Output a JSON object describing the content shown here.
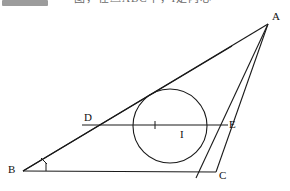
{
  "header": {
    "highlight_swatch_color": "#8e8e8e",
    "clipped_text": "图，在△ABC中，I是内心"
  },
  "figure": {
    "type": "geometry-diagram",
    "stroke_color": "#1a1a1a",
    "background_color": "#ffffff",
    "labels": {
      "a": "A",
      "b": "B",
      "c": "C",
      "d": "D",
      "e": "E",
      "i": "I"
    },
    "points": {
      "A": {
        "x": 268,
        "y": 24
      },
      "B": {
        "x": 23,
        "y": 171
      },
      "C": {
        "x": 216,
        "y": 172
      },
      "D": {
        "x": 99,
        "y": 125
      },
      "E": {
        "x": 227,
        "y": 125
      },
      "I": {
        "x": 176,
        "y": 125
      }
    },
    "incircle": {
      "cx": 170,
      "cy": 126,
      "r": 37
    },
    "segments": [
      {
        "name": "side-AB",
        "from": "A",
        "to": "B"
      },
      {
        "name": "side-BC",
        "from": "B",
        "to": "C"
      },
      {
        "name": "side-CA",
        "from": "C",
        "to": "A"
      },
      {
        "name": "segment-DE",
        "from": "D",
        "to": "E"
      },
      {
        "name": "bisector-BA2",
        "from": "B",
        "to": "A"
      }
    ],
    "tick_marks": [
      {
        "name": "angle-tick-b-upper",
        "x": 44,
        "y": 161
      },
      {
        "name": "angle-tick-b-lower",
        "x": 47,
        "y": 167
      },
      {
        "name": "angle-tick-on-bi",
        "x": 155,
        "y": 127
      }
    ]
  }
}
